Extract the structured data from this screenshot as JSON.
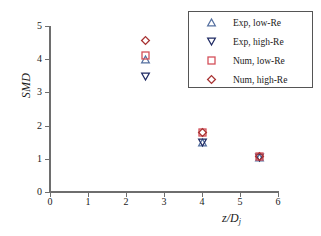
{
  "chart_data": {
    "type": "scatter",
    "title": "",
    "xlabel": "z/Dj",
    "xlabel_main": "z/D",
    "xlabel_sub": "j",
    "ylabel": "SMD",
    "xlim": [
      0,
      6
    ],
    "ylim": [
      0,
      5
    ],
    "xticks": [
      "0",
      "1",
      "2",
      "3",
      "4",
      "5",
      "6"
    ],
    "yticks": [
      "0",
      "1",
      "2",
      "3",
      "4",
      "5"
    ],
    "xtick_values": [
      0,
      1,
      2,
      3,
      4,
      5,
      6
    ],
    "ytick_values": [
      0,
      1,
      2,
      3,
      4,
      5
    ],
    "grid": false,
    "legend_position": "top-right",
    "series": [
      {
        "name": "Exp, low-Re",
        "marker": "triangle-up",
        "color": "#5570a0",
        "filled": false,
        "x": [
          2.5,
          4.0,
          5.5
        ],
        "values": [
          4.0,
          1.5,
          1.05
        ]
      },
      {
        "name": "Exp, high-Re",
        "marker": "triangle-down",
        "color": "#1f2a63",
        "filled": false,
        "x": [
          2.5,
          4.0,
          5.5
        ],
        "values": [
          3.48,
          1.48,
          1.05
        ]
      },
      {
        "name": "Num, low-Re",
        "marker": "square",
        "color": "#d4505a",
        "filled": false,
        "x": [
          2.5,
          4.0,
          5.5
        ],
        "values": [
          4.12,
          1.8,
          1.08
        ]
      },
      {
        "name": "Num, high-Re",
        "marker": "diamond",
        "color": "#a83232",
        "filled": false,
        "x": [
          2.5,
          4.0,
          5.5
        ],
        "values": [
          4.55,
          1.8,
          1.08
        ]
      }
    ]
  },
  "style": {
    "axis_color": "#6e6e6e",
    "legend_border": "#555555",
    "background": "#ffffff",
    "text_color": "#1a1a1a"
  }
}
